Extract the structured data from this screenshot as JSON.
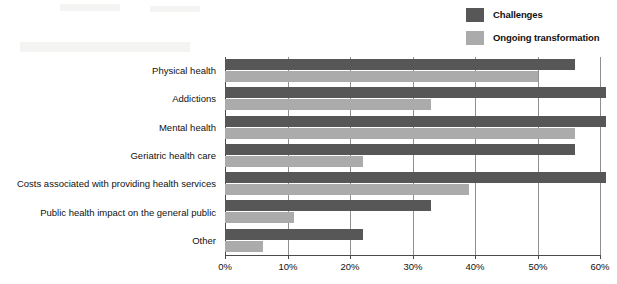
{
  "chart_data": {
    "type": "bar",
    "orientation": "horizontal",
    "title": "",
    "subtitle": "",
    "xlabel": "",
    "ylabel": "",
    "xlim": [
      0,
      60
    ],
    "xticks": [
      0,
      10,
      20,
      30,
      40,
      50,
      60
    ],
    "xtick_labels": [
      "0%",
      "10%",
      "20%",
      "30%",
      "40%",
      "50%",
      "60%"
    ],
    "grid": "vertical",
    "legend_position": "top-right",
    "categories": [
      "Physical health",
      "Addictions",
      "Mental health",
      "Geriatric health care",
      "Costs associated with providing health services",
      "Public health impact on the general public",
      "Other"
    ],
    "series": [
      {
        "name": "Challenges",
        "color": "#575757",
        "values": [
          56,
          61,
          61,
          56,
          61,
          33,
          22
        ]
      },
      {
        "name": "Ongoing transformation",
        "color": "#ababab",
        "values": [
          50,
          33,
          56,
          22,
          39,
          11,
          6
        ]
      }
    ]
  },
  "legend": {
    "items": [
      {
        "label": "Challenges",
        "color": "#575757"
      },
      {
        "label": "Ongoing transformation",
        "color": "#ababab"
      }
    ]
  },
  "colors": {
    "challenges": "#575757",
    "ongoing": "#ababab",
    "gridline": "#8f8f8f",
    "axis": "#4a4a4a",
    "text": "#111111",
    "background": "#ffffff"
  }
}
